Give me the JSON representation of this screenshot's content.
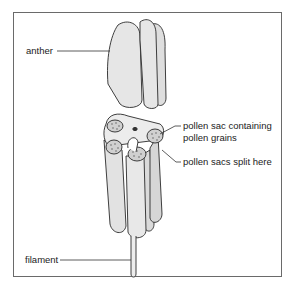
{
  "diagram": {
    "labels": {
      "anther": "anther",
      "pollen_sac_line1": "pollen sac containing",
      "pollen_sac_line2": "pollen grains",
      "split": "pollen sacs split here",
      "filament": "filament"
    },
    "colors": {
      "fill": "#e6e6e6",
      "shade": "#cfcfcf",
      "outline": "#2a2a2a",
      "frame": "#6a6a6a",
      "text": "#222222"
    }
  }
}
